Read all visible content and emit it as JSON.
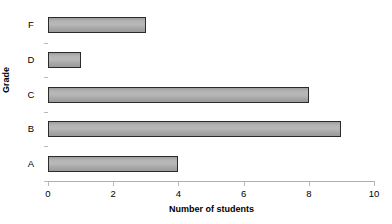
{
  "chart_data": {
    "type": "bar",
    "orientation": "horizontal",
    "title": "",
    "xlabel": "Number of students",
    "ylabel": "Grade",
    "categories": [
      "A",
      "B",
      "C",
      "D",
      "F"
    ],
    "values": [
      4,
      9,
      8,
      1,
      3
    ],
    "category_order_top_to_bottom": [
      "F",
      "D",
      "C",
      "B",
      "A"
    ],
    "xlim": [
      0,
      10
    ],
    "xticks": [
      0,
      2,
      4,
      6,
      8,
      10
    ],
    "xtick_labels": [
      "0",
      "2",
      "4",
      "6",
      "8",
      "10"
    ],
    "grid": false,
    "legend": false,
    "series": [
      {
        "name": "Number of students",
        "values": [
          4,
          9,
          8,
          1,
          3
        ],
        "bar_fill_color": "#b0b0b0",
        "bar_border_color": "#2b2b2b"
      }
    ],
    "colors": {
      "bar_fill": "#b0b0b0",
      "bar_border": "#2b2b2b",
      "axis_line": "#aeaeae",
      "text": "#000000",
      "background": "#ffffff"
    }
  }
}
